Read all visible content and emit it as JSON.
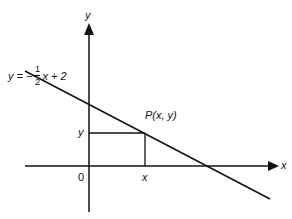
{
  "diagram": {
    "equation": {
      "lhs": "y = −",
      "numerator": "1",
      "denominator": "2",
      "rhs": "x + 2"
    },
    "axes": {
      "x_label": "x",
      "y_label": "y",
      "origin_label": "0"
    },
    "point": {
      "label": "P(x, y)",
      "x_tick_label": "x",
      "y_tick_label": "y"
    },
    "colors": {
      "ink": "#111111",
      "background": "#ffffff"
    }
  }
}
